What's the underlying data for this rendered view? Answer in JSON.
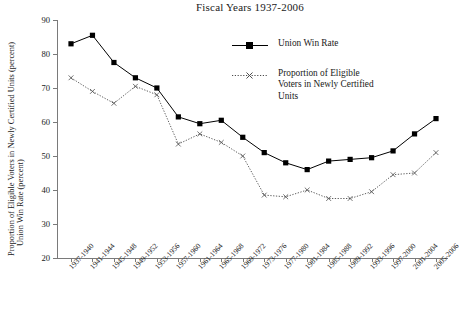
{
  "chart_data": {
    "type": "line",
    "title": "Fiscal Years 1937-2006",
    "xlabel": "",
    "ylabel": "Union Win Rate (percent)  /  Proportion of Eligible Voters in Newly Certified Units (percent)",
    "ylabel_line1": "Union Win Rate (percent)",
    "ylabel_line2": "Proportion of Eligible Voters in Newly Certified Units (percent)",
    "ylim": [
      20,
      90
    ],
    "yticks": [
      20,
      30,
      40,
      50,
      60,
      70,
      80,
      90
    ],
    "grid": false,
    "legend_position": "upper-right-inside",
    "categories": [
      "1937-1940",
      "1941-1944",
      "1945-1948",
      "1949-1952",
      "1953-1956",
      "1957-1960",
      "1961-1964",
      "1965-1968",
      "1969-1972",
      "1973-1976",
      "1977-1980",
      "1981-1984",
      "1985-1988",
      "1989-1992",
      "1993-1996",
      "1997-2000",
      "2001-2004",
      "2005-2006"
    ],
    "series": [
      {
        "name": "Union Win Rate",
        "marker": "filled-square",
        "line_style": "solid",
        "color": "#000000",
        "values": [
          83,
          85.5,
          77.5,
          73,
          70,
          61.5,
          59.5,
          60.5,
          55.5,
          51,
          48,
          46,
          48.5,
          49,
          49.5,
          51.5,
          56.5,
          61
        ]
      },
      {
        "name": "Proportion of Eligible Voters in Newly Certified Units",
        "marker": "open-x",
        "line_style": "dotted",
        "color": "#4d4d4d",
        "values": [
          73,
          69,
          65.5,
          70.5,
          68,
          53.5,
          56.5,
          54,
          50,
          38.5,
          38,
          40,
          37.5,
          37.5,
          39.5,
          44.5,
          45,
          51
        ]
      }
    ],
    "legend_entries": [
      "Union Win Rate",
      "Proportion of Eligible Voters in Newly Certified Units"
    ],
    "legend_entry_lines": [
      [
        "Union Win Rate"
      ],
      [
        "Proportion of Eligible",
        "Voters in Newly Certified",
        "Units"
      ]
    ]
  },
  "colors": {
    "axis": "#7a7a7a",
    "series1": "#000000",
    "series2": "#4d4d4d",
    "background": "#ffffff",
    "text": "#1a1a1a"
  }
}
